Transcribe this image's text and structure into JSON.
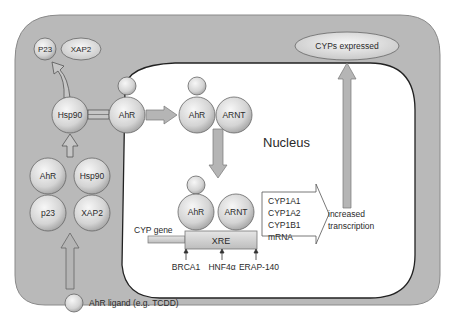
{
  "diagram": {
    "cytoplasm": {
      "released_proteins": [
        "P23",
        "XAP2"
      ],
      "complex": [
        "AhR",
        "Hsp90",
        "p23",
        "XAP2"
      ],
      "hsp90": "Hsp90",
      "ahr_bound": "AhR"
    },
    "nucleus": {
      "label": "Nucleus",
      "heterodimer": [
        "AhR",
        "ARNT"
      ],
      "dna_bound": [
        "AhR",
        "ARNT"
      ],
      "gene_label": "CYP gene",
      "element_label": "XRE",
      "coregulators": [
        "BRCA1",
        "HNF4α",
        "ERAP-140"
      ],
      "mrna_list": [
        "CYP1A1",
        "CYP1A2",
        "CYP1B1",
        "mRNA"
      ],
      "outcome": [
        "increased",
        "transcription"
      ]
    },
    "output": "CYPs expressed",
    "legend": {
      "ligand": "AhR ligand (e.g. TCDD)"
    },
    "colors": {
      "cell": "#b9b9b9",
      "nucleus": "#ffffff",
      "sphere_light": "#f2f2f2",
      "sphere_dark": "#a8a8a8",
      "arrow": "#b0b0b0",
      "outline": "#555555"
    }
  }
}
